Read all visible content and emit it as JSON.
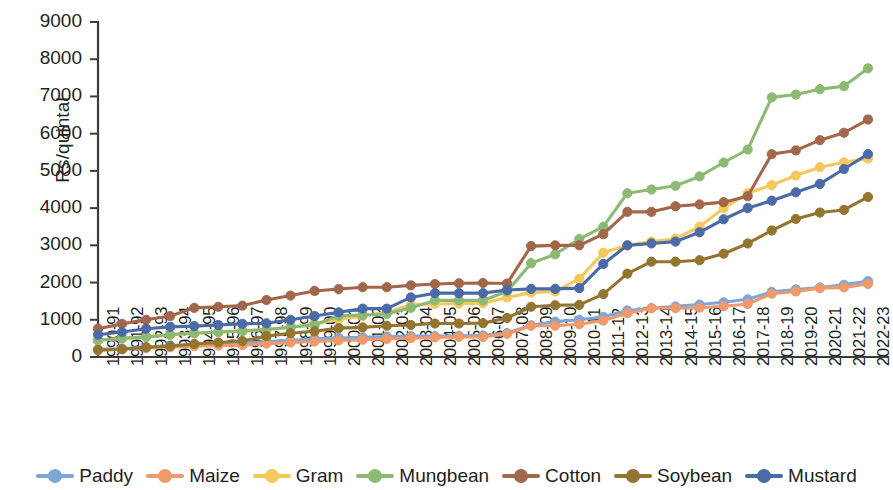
{
  "chart_data": {
    "type": "line",
    "title": "",
    "subtitle": "",
    "xlabel": "",
    "ylabel": "Rs/quintal",
    "ylim": [
      0,
      9000
    ],
    "ytick_values": [
      0,
      1000,
      2000,
      3000,
      4000,
      5000,
      6000,
      7000,
      8000,
      9000
    ],
    "ytick_labels": [
      "0",
      "1000",
      "2000",
      "3000",
      "4000",
      "5000",
      "6000",
      "7000",
      "8000",
      "9000"
    ],
    "grid": false,
    "legend_position": "bottom",
    "categories": [
      "1990-91",
      "1991-92",
      "1992-93",
      "1993-94",
      "1994-95",
      "1995-96",
      "1996-97",
      "1997-98",
      "1998-99",
      "1999-00",
      "2000-01",
      "2001-02",
      "2002-03",
      "2003-04",
      "2004-05",
      "2005-06",
      "2006-07",
      "2007-08",
      "2008-09",
      "2009-10",
      "2010-11",
      "2011-12",
      "2012-13",
      "2013-14",
      "2014-15",
      "2015-16",
      "2016-17",
      "2017-18",
      "2018-19",
      "2019-20",
      "2020-21",
      "2021-22",
      "2022-23"
    ],
    "series": [
      {
        "name": "Paddy",
        "color": "#7FA6D8",
        "values": [
          205,
          230,
          270,
          310,
          340,
          360,
          380,
          415,
          440,
          490,
          510,
          530,
          550,
          560,
          560,
          570,
          580,
          645,
          850,
          950,
          1000,
          1080,
          1250,
          1310,
          1360,
          1410,
          1470,
          1550,
          1750,
          1815,
          1868,
          1940,
          2040
        ]
      },
      {
        "name": "Maize",
        "color": "#F0996B",
        "values": [
          180,
          210,
          240,
          260,
          290,
          310,
          320,
          360,
          390,
          415,
          445,
          465,
          485,
          505,
          525,
          540,
          540,
          620,
          840,
          840,
          880,
          980,
          1175,
          1310,
          1310,
          1325,
          1365,
          1425,
          1700,
          1760,
          1850,
          1870,
          1962
        ]
      },
      {
        "name": "Gram",
        "color": "#F6C75A",
        "values": [
          450,
          500,
          540,
          600,
          640,
          670,
          700,
          740,
          800,
          895,
          1015,
          1100,
          1200,
          1400,
          1425,
          1435,
          1445,
          1600,
          1730,
          1760,
          2100,
          2800,
          3000,
          3100,
          3175,
          3500,
          4000,
          4400,
          4620,
          4875,
          5100,
          5230,
          5335
        ]
      },
      {
        "name": "Mungbean",
        "color": "#8CBA72",
        "values": [
          450,
          500,
          540,
          600,
          640,
          670,
          700,
          740,
          800,
          860,
          1105,
          1125,
          1155,
          1320,
          1520,
          1520,
          1520,
          1760,
          2520,
          2760,
          3170,
          3500,
          4400,
          4500,
          4600,
          4850,
          5225,
          5575,
          6975,
          7050,
          7196,
          7275,
          7755
        ]
      },
      {
        "name": "Cotton",
        "color": "#A2674B",
        "values": [
          760,
          890,
          1000,
          1100,
          1320,
          1350,
          1380,
          1530,
          1650,
          1775,
          1825,
          1875,
          1875,
          1925,
          1960,
          1980,
          1990,
          1975,
          2980,
          3000,
          3000,
          3300,
          3900,
          3900,
          4050,
          4100,
          4160,
          4320,
          5450,
          5550,
          5825,
          6025,
          6380
        ]
      },
      {
        "name": "Soybean",
        "color": "#94752F",
        "values": [
          190,
          210,
          260,
          290,
          350,
          390,
          430,
          560,
          640,
          690,
          775,
          795,
          840,
          860,
          900,
          900,
          910,
          1050,
          1350,
          1390,
          1400,
          1690,
          2240,
          2560,
          2560,
          2600,
          2775,
          3050,
          3399,
          3710,
          3880,
          3950,
          4300
        ]
      },
      {
        "name": "Mustard",
        "color": "#4A6BA8",
        "values": [
          600,
          670,
          760,
          810,
          830,
          860,
          890,
          905,
          1000,
          1100,
          1200,
          1300,
          1300,
          1600,
          1715,
          1715,
          1715,
          1800,
          1830,
          1830,
          1850,
          2500,
          3000,
          3050,
          3100,
          3350,
          3700,
          4000,
          4200,
          4425,
          4650,
          5050,
          5450
        ]
      }
    ]
  },
  "legend": {
    "items": [
      {
        "label": "Paddy"
      },
      {
        "label": "Maize"
      },
      {
        "label": "Gram"
      },
      {
        "label": "Mungbean"
      },
      {
        "label": "Cotton"
      },
      {
        "label": "Soybean"
      },
      {
        "label": "Mustard"
      }
    ]
  }
}
